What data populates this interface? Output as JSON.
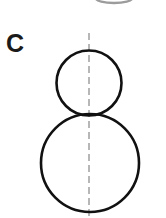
{
  "panel": {
    "label": "C",
    "background_color": "#ffffff",
    "width": 166,
    "height": 218
  },
  "figure": {
    "name": "two-tangent-circles-with-symmetry-axis",
    "stroke_color": "#111111",
    "stroke_width": 2.6,
    "fill": "none",
    "axis": {
      "name": "vertical-dashed-symmetry-axis",
      "color": "#a6a6a6",
      "stroke_width": 1.6,
      "dash_pattern": "7 4",
      "x": 89,
      "y_top": 33,
      "y_bottom": 216
    },
    "shapes": [
      {
        "name": "upper-small-circle",
        "type": "circle",
        "cx": 89,
        "cy": 83,
        "r": 32.5
      },
      {
        "name": "lower-large-circle",
        "type": "circle",
        "cx": 90,
        "cy": 163,
        "r": 49
      }
    ],
    "tangent_point": {
      "name": "circle-tangency-point",
      "x": 89,
      "y": 116
    }
  },
  "cropped_fragment": {
    "name": "partial-arc-from-figure-above",
    "color": "#3c3c3c",
    "x": 96,
    "y": -6,
    "width": 36,
    "height": 9
  }
}
